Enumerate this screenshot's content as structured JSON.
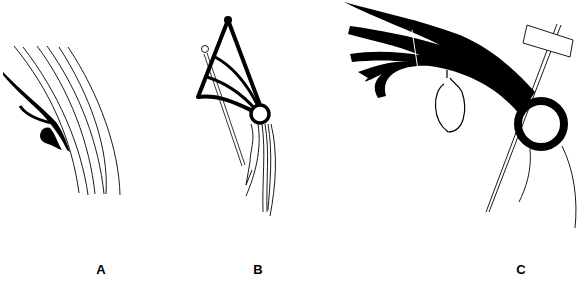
{
  "figure": {
    "panels": [
      {
        "id": "A",
        "label": "A",
        "label_x": 101,
        "label_y": 262
      },
      {
        "id": "B",
        "label": "B",
        "label_x": 258,
        "label_y": 262
      },
      {
        "id": "C",
        "label": "C",
        "label_x": 521,
        "label_y": 262
      }
    ],
    "colors": {
      "ink": "#000000",
      "background": "#ffffff"
    }
  }
}
